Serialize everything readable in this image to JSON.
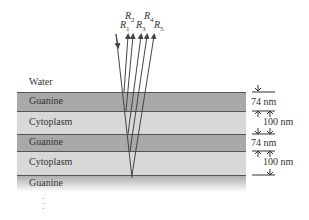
{
  "layers": {
    "water": "Water",
    "guanine1": "Guanine",
    "cytoplasm1": "Cytoplasm",
    "guanine2": "Guanine",
    "cytoplasm2": "Cytoplasm",
    "guanine3": "Guanine"
  },
  "rays": {
    "r1": "R",
    "r1_sub": "1",
    "r2": "R",
    "r2_sub": "2",
    "r3": "R",
    "r3_sub": "3",
    "r4": "R",
    "r4_sub": "4",
    "r5": "R",
    "r5_sub": "5"
  },
  "dimensions": {
    "guanine_thickness_1": "74 nm",
    "cytoplasm_thickness_1": "100 nm",
    "guanine_thickness_2": "74 nm",
    "cytoplasm_thickness_2": "100 nm"
  },
  "continuation": "⋮"
}
